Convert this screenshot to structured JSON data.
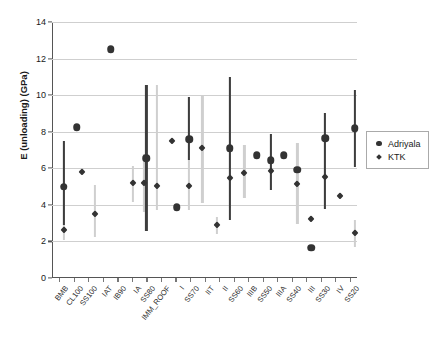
{
  "chart_data": {
    "type": "scatter",
    "title": "",
    "xlabel": "",
    "ylabel": "E (unloading) (GPa)",
    "ylim": [
      0,
      14
    ],
    "yticks": [
      0,
      2,
      4,
      6,
      8,
      10,
      12,
      14
    ],
    "grid": true,
    "legend_position": "right",
    "legend": [
      "Adriyala",
      "KTK"
    ],
    "categories": [
      "BMB",
      "CL100",
      "SS100",
      "IAT",
      "IB90",
      "IA",
      "SS80",
      "IMM_ROOF",
      "I",
      "SS70",
      "IIT",
      "II",
      "SS60",
      "IIIB",
      "SS50",
      "IIIA",
      "SS40",
      "III",
      "SS30",
      "IV",
      "SS20"
    ],
    "series": [
      {
        "name": "Adriyala",
        "color": "#333333",
        "marker": "circle",
        "errorbar_color": "#3d3d3d",
        "points": [
          {
            "x": 0.3,
            "y": 5.0,
            "low": 2.9,
            "high": 7.5
          },
          {
            "x": 1.2,
            "y": 8.25,
            "low": null,
            "high": null
          },
          {
            "x": 3.55,
            "y": 12.5,
            "low": null,
            "high": null
          },
          {
            "x": 6.0,
            "y": 6.55,
            "low": 2.55,
            "high": 10.55
          },
          {
            "x": 8.1,
            "y": 3.88,
            "low": null,
            "high": null
          },
          {
            "x": 8.95,
            "y": 7.6,
            "low": 6.45,
            "high": 9.9
          },
          {
            "x": 11.75,
            "y": 7.1,
            "low": 3.15,
            "high": 11.0
          },
          {
            "x": 13.6,
            "y": 6.72,
            "low": null,
            "high": null
          },
          {
            "x": 14.55,
            "y": 6.45,
            "low": 4.8,
            "high": 7.9
          },
          {
            "x": 15.45,
            "y": 6.72,
            "low": null,
            "high": null
          },
          {
            "x": 16.4,
            "y": 5.92,
            "low": null,
            "high": null
          },
          {
            "x": 17.35,
            "y": 1.65,
            "low": null,
            "high": null
          },
          {
            "x": 18.3,
            "y": 7.65,
            "low": 3.75,
            "high": 9.0
          },
          {
            "x": 20.35,
            "y": 8.2,
            "low": 6.05,
            "high": 10.3
          }
        ]
      },
      {
        "name": "KTK",
        "color": "#333333",
        "marker": "diamond",
        "errorbar_color": "#cfcfcf",
        "points": [
          {
            "x": 0.3,
            "y": 2.65,
            "low": 2.1,
            "high": 7.5
          },
          {
            "x": 1.55,
            "y": 5.82,
            "low": null,
            "high": null
          },
          {
            "x": 2.45,
            "y": 3.48,
            "low": 2.25,
            "high": 5.1
          },
          {
            "x": 5.05,
            "y": 5.2,
            "low": 4.15,
            "high": 6.15
          },
          {
            "x": 5.8,
            "y": 5.22,
            "low": 3.6,
            "high": 6.8
          },
          {
            "x": 6.7,
            "y": 5.05,
            "low": 3.7,
            "high": 10.55
          },
          {
            "x": 7.75,
            "y": 7.48,
            "low": null,
            "high": null
          },
          {
            "x": 8.95,
            "y": 5.05,
            "low": 3.7,
            "high": 9.9
          },
          {
            "x": 9.85,
            "y": 7.12,
            "low": 4.1,
            "high": 10.0
          },
          {
            "x": 10.85,
            "y": 2.9,
            "low": 2.4,
            "high": 3.35
          },
          {
            "x": 11.75,
            "y": 5.48,
            "low": 3.85,
            "high": 11.0
          },
          {
            "x": 12.75,
            "y": 5.75,
            "low": 4.35,
            "high": 7.25
          },
          {
            "x": 14.55,
            "y": 5.85,
            "low": 4.8,
            "high": 7.9
          },
          {
            "x": 16.4,
            "y": 5.15,
            "low": 2.95,
            "high": 7.4
          },
          {
            "x": 17.35,
            "y": 3.25,
            "low": null,
            "high": null
          },
          {
            "x": 18.3,
            "y": 5.5,
            "low": 3.75,
            "high": 9.0
          },
          {
            "x": 19.35,
            "y": 4.48,
            "low": null,
            "high": null
          },
          {
            "x": 20.35,
            "y": 2.45,
            "low": 1.7,
            "high": 3.15
          }
        ]
      }
    ]
  }
}
